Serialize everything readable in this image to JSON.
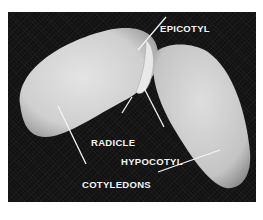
{
  "figure": {
    "labels": {
      "epicotyl": "EPICOTYL",
      "radicle": "RADICLE",
      "hypocotyl": "HYPOCOTYL",
      "cotyledons": "COTYLEDONS"
    },
    "colors": {
      "background": "#121212",
      "seed": "#d9d9d9",
      "label": "#f4f4f4",
      "page": "#ffffff"
    }
  }
}
